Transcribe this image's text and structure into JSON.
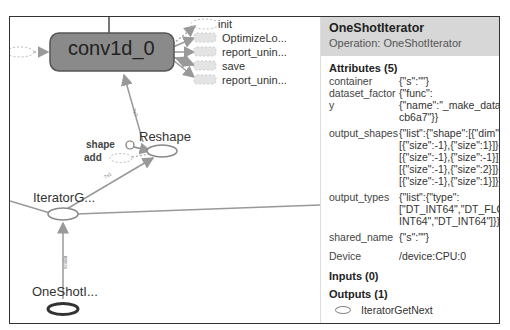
{
  "graph": {
    "nodes": {
      "conv": {
        "label": "conv1d_0"
      },
      "reshape": {
        "label": "Reshape"
      },
      "iterator_get": {
        "label": "IteratorG..."
      },
      "one_shot": {
        "label": "OneShotI..."
      }
    },
    "conv_outputs": [
      "init",
      "OptimizeLo...",
      "report_unin...",
      "save",
      "report_unin..."
    ],
    "reshape_inputs": [
      "shape",
      "add"
    ],
    "edge_labels": [
      "?x?",
      "?x1",
      "scalar"
    ]
  },
  "panel": {
    "title": "OneShotIterator",
    "operation": "Operation: OneShotIterator",
    "attributes_heading": "Attributes (5)",
    "attributes": [
      {
        "key": "container",
        "value": "{\"s\":\"\"}"
      },
      {
        "key": "dataset_factory",
        "value": "{\"func\":\n{\"name\":\"_make_datas\ncb6a7\"}}"
      },
      {
        "key": "output_shapes",
        "value": "{\"list\":{\"shape\":[{\"dim\":\n[{\"size\":-1},{\"size\":1}]},{\n[{\"size\":-1},{\"size\":-1}]},\n[{\"size\":-1},{\"size\":2}]},{\n[{\"size\":-1},{\"size\":1}]}]}"
      },
      {
        "key": "output_types",
        "value": "{\"list\":{\"type\":\n[\"DT_INT64\",\"DT_FLOA\nINT64\",\"DT_INT64\"]}}"
      },
      {
        "key": "shared_name",
        "value": "{\"s\":\"\"}"
      }
    ],
    "device_key": "Device",
    "device_value": "/device:CPU:0",
    "inputs_heading": "Inputs (0)",
    "outputs_heading": "Outputs (1)",
    "outputs": [
      "IteratorGetNext"
    ]
  }
}
